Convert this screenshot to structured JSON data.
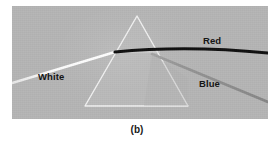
{
  "figure": {
    "caption": "(b)",
    "panel": {
      "background_color": "#b5b5b5",
      "x": 12,
      "y": 6,
      "width": 256,
      "height": 113
    }
  },
  "labels": {
    "white": "White",
    "red": "Red",
    "blue": "Blue"
  },
  "colors": {
    "background": "#b5b5b5",
    "prism_outline": "#f2f2f2",
    "incident_ray": "#fbfbfb",
    "red_ray": "#101010",
    "blue_ray": "#8f8f8f",
    "label_text": "#151515",
    "caption_text": "#1a1a1a",
    "page": "#ffffff"
  },
  "geometry": {
    "prism": {
      "apex": {
        "x": 125,
        "y": 10
      },
      "base_left": {
        "x": 73,
        "y": 100
      },
      "base_right": {
        "x": 176,
        "y": 100
      }
    },
    "incident_ray": {
      "from": {
        "x": 0,
        "y": 77
      },
      "to": {
        "x": 102,
        "y": 46
      }
    },
    "red_ray": {
      "from": {
        "x": 102,
        "y": 46
      },
      "ctrl": {
        "x": 175,
        "y": 41
      },
      "to": {
        "x": 256,
        "y": 47
      }
    },
    "blue_ray": {
      "from": {
        "x": 140,
        "y": 49
      },
      "to": {
        "x": 256,
        "y": 95
      }
    }
  }
}
